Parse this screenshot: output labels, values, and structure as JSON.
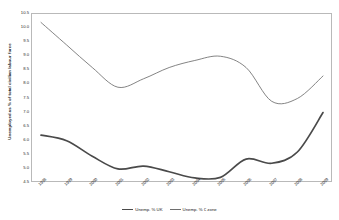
{
  "chart_data": {
    "type": "line",
    "title": "",
    "xlabel": "",
    "ylabel": "Unemployed as % of total civilian labour force",
    "x": [
      "1998",
      "1999",
      "2000",
      "2001",
      "2002",
      "2003",
      "2004",
      "2005",
      "2006",
      "2007",
      "2008",
      "2009"
    ],
    "categories": [
      "1998",
      "1999",
      "2000",
      "2001",
      "2002",
      "2003",
      "2004",
      "2005",
      "2006",
      "2007",
      "2008",
      "2009"
    ],
    "ylim": [
      4.5,
      10.5
    ],
    "ytick_step": 0.5,
    "yticks": [
      "10.5",
      "10.0",
      "9.5",
      "9.0",
      "8.5",
      "8.0",
      "7.5",
      "7.0",
      "6.5",
      "6.0",
      "5.5",
      "5.0",
      "4.5"
    ],
    "grid": false,
    "legend_position": "bottom-center",
    "smoothed": true,
    "series": [
      {
        "name": "Unemp. % UK",
        "color": "#4a4a4a",
        "width": 1.7,
        "values": [
          6.2,
          6.0,
          5.45,
          5.0,
          5.1,
          4.9,
          4.68,
          4.7,
          5.35,
          5.2,
          5.6,
          7.0
        ]
      },
      {
        "name": "Unemp. % € zone",
        "color": "#6e6e6e",
        "width": 0.85,
        "values": [
          10.2,
          9.4,
          8.6,
          7.9,
          8.2,
          8.6,
          8.85,
          9.0,
          8.6,
          7.4,
          7.5,
          8.3
        ]
      }
    ]
  },
  "legend": {
    "entries": [
      {
        "label": "Unemp. % UK"
      },
      {
        "label": "Unemp. % € zone"
      }
    ]
  }
}
